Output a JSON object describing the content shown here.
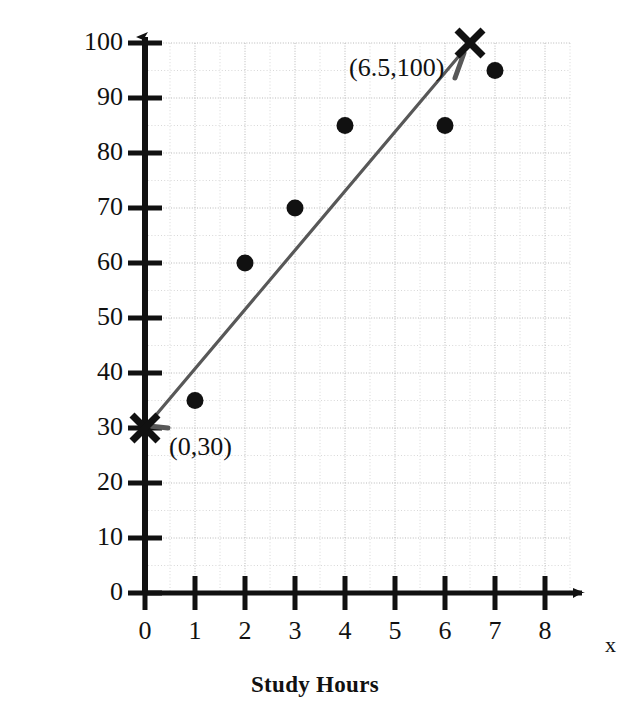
{
  "chart_data": {
    "type": "scatter",
    "title": "",
    "xlabel": "Study Hours",
    "ylabel": "Regent's Score",
    "x_axis_variable": "x",
    "xlim": [
      0,
      8.6
    ],
    "ylim": [
      0,
      100
    ],
    "xticks": [
      0,
      1,
      2,
      3,
      4,
      5,
      6,
      7,
      8
    ],
    "xtick_labels": [
      "0",
      "1",
      "2",
      "3",
      "4",
      "5",
      "6",
      "7",
      "8"
    ],
    "yticks": [
      0,
      10,
      20,
      30,
      40,
      50,
      60,
      70,
      80,
      90,
      100
    ],
    "ytick_labels": [
      "0",
      "10",
      "20",
      "30",
      "40",
      "50",
      "60",
      "70",
      "80",
      "90",
      "100"
    ],
    "grid": true,
    "grid_major_step_x": 1,
    "grid_minor_step_x": 0.5,
    "grid_major_step_y": 10,
    "grid_minor_step_y": 5,
    "legend": false,
    "series": [
      {
        "name": "Student data points",
        "marker": "filled-circle",
        "color": "#111111",
        "points": [
          {
            "x": 1,
            "y": 35
          },
          {
            "x": 2,
            "y": 60
          },
          {
            "x": 3,
            "y": 70
          },
          {
            "x": 4,
            "y": 85
          },
          {
            "x": 6,
            "y": 85
          },
          {
            "x": 7,
            "y": 95
          }
        ]
      },
      {
        "name": "Line of best fit endpoints",
        "marker": "x-cross",
        "color": "#111111",
        "points": [
          {
            "x": 0,
            "y": 30,
            "label": "(0,30)"
          },
          {
            "x": 6.5,
            "y": 100,
            "label": "(6.5,100)"
          }
        ]
      }
    ],
    "trend_line": {
      "name": "line of best fit",
      "color": "#555555",
      "from": {
        "x": 0,
        "y": 30
      },
      "to": {
        "x": 6.5,
        "y": 100
      },
      "slope": 10.769,
      "intercept": 30
    },
    "annotations": [
      {
        "id": "upper",
        "text": "(6.5,100)",
        "points_to": {
          "x": 6.5,
          "y": 100
        }
      },
      {
        "id": "lower",
        "text": "(0,30)",
        "points_to": {
          "x": 0,
          "y": 30
        }
      }
    ]
  },
  "colors": {
    "axis": "#111111",
    "grid_major": "#b9b9b9",
    "grid_minor": "#d8d8d8",
    "marker": "#111111",
    "trend": "#585858",
    "background": "#ffffff"
  }
}
